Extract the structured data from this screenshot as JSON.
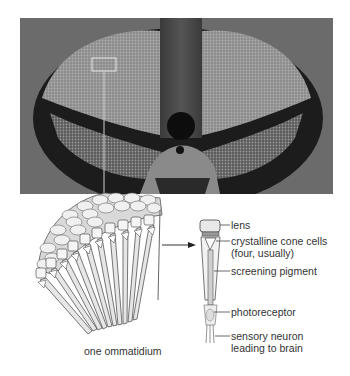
{
  "figure": {
    "photo": {
      "subject": "compound eyes of an insect (micrograph)",
      "highlight_box": "selected region of eye surface"
    },
    "left_diagram": {
      "caption": "one ommatidium"
    },
    "right_diagram": {
      "labels": [
        {
          "text": "lens"
        },
        {
          "text": "crystalline cone cells"
        },
        {
          "text": "(four, usually)"
        },
        {
          "text": "screening pigment"
        },
        {
          "text": "photoreceptor"
        },
        {
          "text": "sensory neuron"
        },
        {
          "text": "leading to brain"
        }
      ]
    }
  },
  "colors": {
    "photo_bg": "#6e6e6e",
    "eye_dark": "#1a1a1a",
    "eye_light": "#9a9a9a",
    "line": "#444444",
    "facet": "#d8d8d8"
  }
}
